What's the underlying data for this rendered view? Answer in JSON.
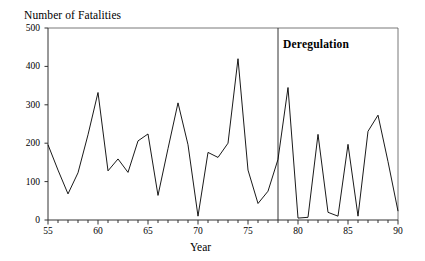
{
  "figure": {
    "title_y": "Number of Fatalities",
    "title_x": "Year",
    "annotation": "Deregulation"
  },
  "chart_data": {
    "type": "line",
    "title": "",
    "ylabel": "Number of Fatalities",
    "xlabel": "Year",
    "xlim": [
      55,
      90
    ],
    "ylim": [
      0,
      500
    ],
    "yticks": [
      0,
      100,
      200,
      300,
      400,
      500
    ],
    "ytick_labels": [
      "0",
      "100",
      "200",
      "300",
      "400",
      "500"
    ],
    "xticks": [
      55,
      60,
      65,
      70,
      75,
      80,
      85,
      90
    ],
    "xtick_labels": [
      "55",
      "60",
      "65",
      "70",
      "75",
      "80",
      "85",
      "90"
    ],
    "x_minor_tick_step": 1,
    "grid": false,
    "legend": false,
    "line_color": "#000000",
    "annotations": [
      {
        "text": "Deregulation",
        "type": "vertical-line-with-label",
        "x": 78,
        "label_x": 79,
        "label_y": 470
      }
    ],
    "x": [
      55,
      56,
      57,
      58,
      59,
      60,
      61,
      62,
      63,
      64,
      65,
      66,
      67,
      68,
      69,
      70,
      71,
      72,
      73,
      74,
      75,
      76,
      77,
      78,
      79,
      80,
      81,
      82,
      83,
      84,
      85,
      86,
      87,
      88,
      89,
      90
    ],
    "values": [
      196,
      130,
      68,
      123,
      222,
      332,
      128,
      159,
      124,
      206,
      224,
      64,
      186,
      305,
      196,
      10,
      176,
      163,
      200,
      420,
      130,
      43,
      75,
      158,
      345,
      5,
      7,
      223,
      20,
      10,
      197,
      10,
      231,
      273,
      152,
      23
    ],
    "series": [
      {
        "name": "Fatalities",
        "values": [
          196,
          130,
          68,
          123,
          222,
          332,
          128,
          159,
          124,
          206,
          224,
          64,
          186,
          305,
          196,
          10,
          176,
          163,
          200,
          420,
          130,
          43,
          75,
          158,
          345,
          5,
          7,
          223,
          20,
          10,
          197,
          10,
          231,
          273,
          152,
          23
        ]
      }
    ]
  },
  "axes": {
    "plot_left_px": 48,
    "plot_right_px": 398,
    "plot_top_px": 28,
    "plot_bottom_px": 220
  }
}
